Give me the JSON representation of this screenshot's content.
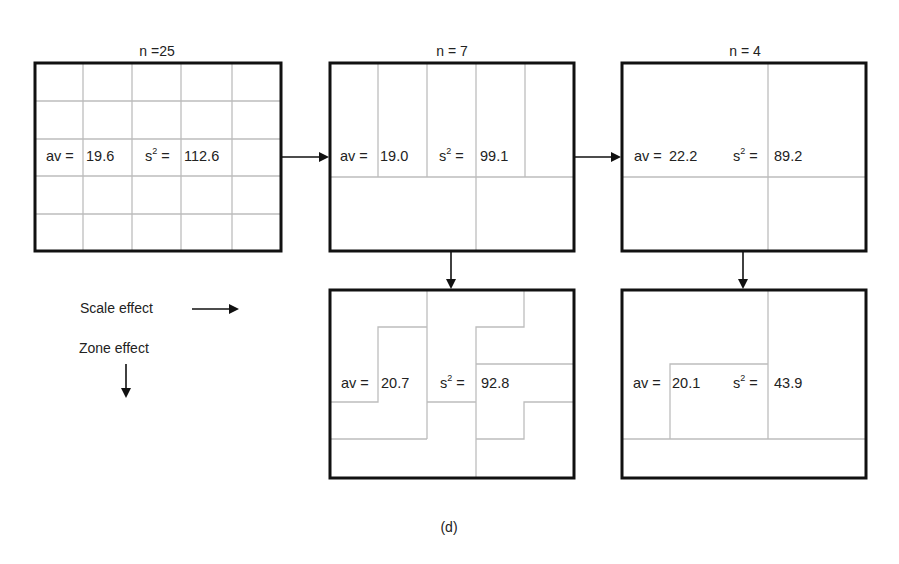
{
  "caption": "(d)",
  "legend": {
    "scale_effect": "Scale effect",
    "zone_effect": "Zone effect"
  },
  "colors": {
    "border": "#111111",
    "grid": "#bdbdbd",
    "text": "#222222"
  },
  "panels": [
    {
      "id": "n25",
      "n_label": "n =25",
      "av_label": "av =",
      "av_value": "19.6",
      "s2_label": "s",
      "s2_sup": "2",
      "s2_eq": " =",
      "s2_value": "112.6"
    },
    {
      "id": "n7",
      "n_label": "n = 7",
      "av_label": "av =",
      "av_value": "19.0",
      "s2_label": "s",
      "s2_sup": "2",
      "s2_eq": " =",
      "s2_value": "99.1"
    },
    {
      "id": "n4",
      "n_label": "n = 4",
      "av_label": "av = ",
      "av_value": "22.2",
      "s2_label": "s",
      "s2_sup": "2",
      "s2_eq": " =",
      "s2_value": "89.2"
    },
    {
      "id": "n7-zoned",
      "av_label": "av =",
      "av_value": "20.7",
      "s2_label": "s",
      "s2_sup": "2",
      "s2_eq": " =",
      "s2_value": "92.8"
    },
    {
      "id": "n4-zoned",
      "av_label": "av =",
      "av_value": "20.1",
      "s2_label": "s",
      "s2_sup": "2",
      "s2_eq": " =",
      "s2_value": "43.9"
    }
  ]
}
